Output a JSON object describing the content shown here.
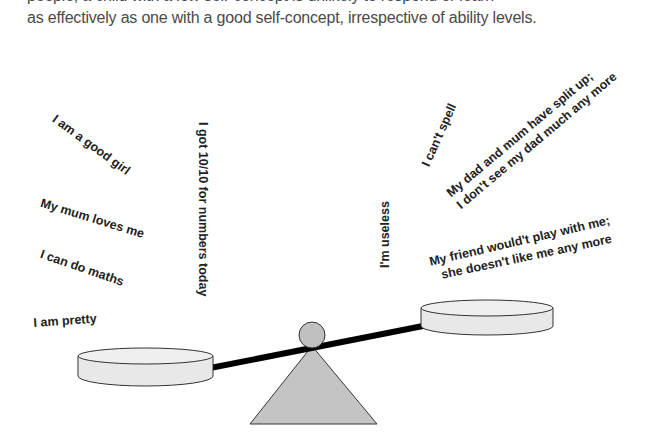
{
  "caption": {
    "line_cut": "people, a child with a low self-concept is unlikely to respond or learn",
    "line_visible": "as effectively as one with a good self-concept, irrespective of ability levels."
  },
  "positive_statements": [
    "I am a good girl",
    "My mum loves me",
    "I can do maths",
    "I am pretty",
    "I got 10/10 for numbers today"
  ],
  "negative_statements": [
    "I can't spell",
    "I'm useless",
    "My dad and mum have split up;",
    "I don't see my dad much any more",
    "My friend would't play with me;",
    "she doesn't like me any more"
  ],
  "diagram": {
    "type": "seesaw/balance",
    "left_pan": "positive statements (heavier, lower)",
    "right_pan": "negative statements (lighter, higher)",
    "colors": {
      "pan_fill": "#e6e6e6",
      "fulcrum_fill": "#c4c4c4",
      "beam": "#000000",
      "outline": "#333333"
    }
  }
}
